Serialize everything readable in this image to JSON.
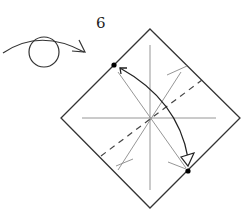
{
  "diagram": {
    "type": "origami-step",
    "step_number": "6",
    "symbols": {
      "flip": "turn-over-icon",
      "fold_arrow": "valley-fold-arrow",
      "reference_dots": 2
    },
    "square": {
      "orientation": "diamond",
      "corners": {
        "top": [
          150,
          29
        ],
        "right": [
          240,
          118
        ],
        "bottom": [
          150,
          208
        ],
        "left": [
          61,
          118
        ]
      }
    },
    "colors": {
      "outline": "#333333",
      "crease": "#888888",
      "dashed": "#444444",
      "arrow": "#222222",
      "dot": "#000000"
    }
  }
}
